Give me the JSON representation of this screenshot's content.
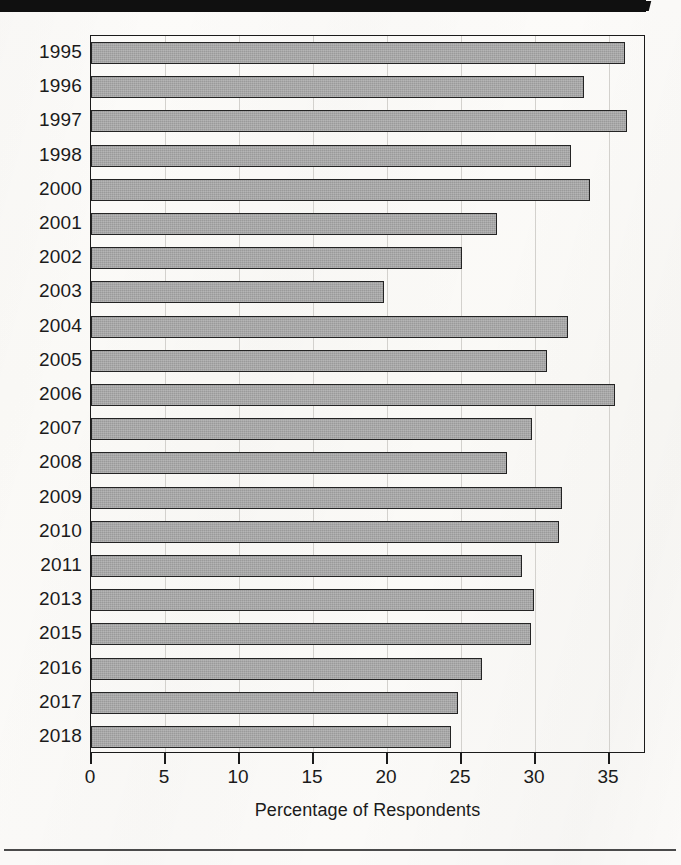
{
  "page": {
    "background_color": "#fbfaf8",
    "top_bar_color": "#101010",
    "bottom_rule_color": "#4a4a4a"
  },
  "chart_data": {
    "type": "bar",
    "orientation": "horizontal",
    "title": "",
    "subtitle": "",
    "xlabel": "Percentage of Respondents",
    "ylabel": "",
    "xlim": [
      0,
      37.5
    ],
    "xticks": [
      0,
      5,
      10,
      15,
      20,
      25,
      30,
      35
    ],
    "xtick_labels": [
      "0",
      "5",
      "10",
      "15",
      "20",
      "25",
      "30",
      "35"
    ],
    "grid": "vertical",
    "legend": null,
    "bar_fill_color": "#a2a2a2",
    "bar_edge_color": "#242424",
    "categories": [
      "1995",
      "1996",
      "1997",
      "1998",
      "2000",
      "2001",
      "2002",
      "2003",
      "2004",
      "2005",
      "2006",
      "2007",
      "2008",
      "2009",
      "2010",
      "2011",
      "2013",
      "2015",
      "2016",
      "2017",
      "2018"
    ],
    "values": [
      36.1,
      33.3,
      36.2,
      32.4,
      33.7,
      27.4,
      25.1,
      19.8,
      32.2,
      30.8,
      35.4,
      29.8,
      28.1,
      31.8,
      31.6,
      29.1,
      29.9,
      29.7,
      26.4,
      24.8,
      24.3
    ]
  }
}
